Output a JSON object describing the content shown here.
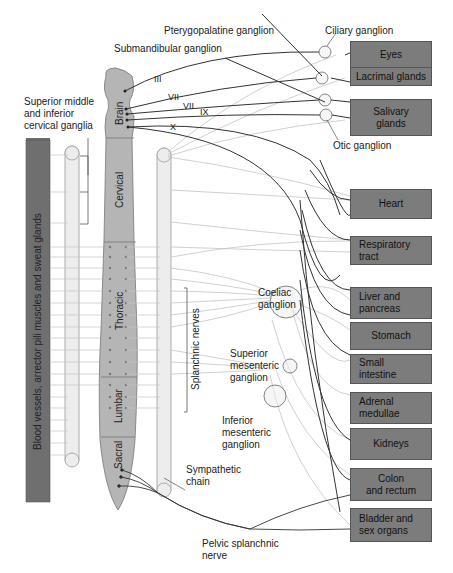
{
  "diagram": {
    "ganglia_labels": {
      "pterygopalatine": "Pterygopalatine ganglion",
      "ciliary": "Ciliary ganglion",
      "submandibular": "Submandibular ganglion",
      "otic": "Otic ganglion",
      "cervical": "Superior middle\nand inferior\ncervical ganglia",
      "coeliac": "Coeliac ganglion",
      "superior_mesenteric": "Superior mesenteric ganglion",
      "inferior_mesenteric": "Inferior mesenteric ganglion",
      "sympathetic_chain": "Sympathetic chain",
      "pelvic_splanchnic": "Pelvic splanchnic nerve",
      "splanchnic_nerves": "Splanchnic nerves"
    },
    "cervical_ganglia_lines": [
      "Superior middle",
      "and inferior",
      "cervical ganglia"
    ],
    "coeliac_lines": [
      "Coeliac",
      "ganglion"
    ],
    "sup_mes_lines": [
      "Superior",
      "mesenteric",
      "ganglion"
    ],
    "inf_mes_lines": [
      "Inferior",
      "mesenteric",
      "ganglion"
    ],
    "symp_chain_lines": [
      "Sympathetic",
      "chain"
    ],
    "pelvic_lines": [
      "Pelvic splanchnic",
      "nerve"
    ],
    "cranial_nerves": [
      "III",
      "VII",
      "VII",
      "IX",
      "X"
    ],
    "spinal_regions": [
      "Brain",
      "Cervical",
      "Thoracic",
      "Lumbar",
      "Sacral"
    ],
    "left_bar_label": "Blood vessels, arrector pili muscles and sweat glands",
    "organs": [
      {
        "name": "Eyes"
      },
      {
        "name": "Lacrimal glands"
      },
      {
        "name": "Salivary glands",
        "lines": [
          "Salivary",
          "glands"
        ]
      },
      {
        "name": "Heart"
      },
      {
        "name": "Respiratory tract",
        "lines": [
          "Respiratory",
          "tract"
        ]
      },
      {
        "name": "Liver and pancreas",
        "lines": [
          "Liver and",
          "pancreas"
        ]
      },
      {
        "name": "Stomach"
      },
      {
        "name": "Small intestine",
        "lines": [
          "Small",
          "intestine"
        ]
      },
      {
        "name": "Adrenal medullae",
        "lines": [
          "Adrenal",
          "medullae"
        ]
      },
      {
        "name": "Kidneys"
      },
      {
        "name": "Colon and rectum",
        "lines": [
          "Colon",
          "and rectum"
        ]
      },
      {
        "name": "Bladder and sex organs",
        "lines": [
          "Bladder and",
          "sex organs"
        ]
      }
    ],
    "colors": {
      "organ_fill": "#7c7c7c",
      "cord_fill": "#b5b5b5",
      "left_bar_fill": "#6f6f6f",
      "chain_fill": "#ededed",
      "parasympathetic_line": "#333333",
      "sympathetic_line": "#bdbdbd"
    }
  }
}
